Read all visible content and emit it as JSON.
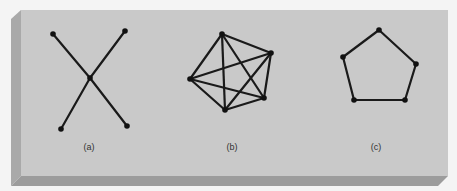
{
  "colors": {
    "background": "#f4f4f4",
    "panel_face": "#c9c9c9",
    "panel_left_bevel": "#a9a9a9",
    "panel_bottom_bevel": "#9c9c9c",
    "edge": "#1a1a1a",
    "vertex": "#111111",
    "label": "#333333"
  },
  "figures": [
    {
      "id": "a",
      "label": "(a)",
      "label_pos": [
        89,
        150
      ],
      "vertices": [
        [
          53,
          34
        ],
        [
          125,
          31
        ],
        [
          90,
          78
        ],
        [
          61,
          129
        ],
        [
          127,
          126
        ]
      ],
      "edges": [
        [
          0,
          2
        ],
        [
          2,
          4
        ],
        [
          1,
          2
        ],
        [
          2,
          3
        ]
      ]
    },
    {
      "id": "b",
      "label": "(b)",
      "label_pos": [
        232,
        150
      ],
      "vertices": [
        [
          222,
          34
        ],
        [
          271,
          53
        ],
        [
          264,
          98
        ],
        [
          225,
          110
        ],
        [
          190,
          79
        ]
      ],
      "edges": [
        [
          0,
          1
        ],
        [
          0,
          2
        ],
        [
          0,
          3
        ],
        [
          0,
          4
        ],
        [
          1,
          2
        ],
        [
          1,
          3
        ],
        [
          1,
          4
        ],
        [
          2,
          3
        ],
        [
          2,
          4
        ],
        [
          3,
          4
        ]
      ]
    },
    {
      "id": "c",
      "label": "(c)",
      "label_pos": [
        376,
        150
      ],
      "vertices": [
        [
          379,
          30
        ],
        [
          416,
          64
        ],
        [
          405,
          100
        ],
        [
          354,
          100
        ],
        [
          343,
          57
        ]
      ],
      "edges": [
        [
          0,
          1
        ],
        [
          1,
          2
        ],
        [
          2,
          3
        ],
        [
          3,
          4
        ],
        [
          4,
          0
        ]
      ]
    }
  ],
  "labels": {
    "a": "(a)",
    "b": "(b)",
    "c": "(c)"
  }
}
